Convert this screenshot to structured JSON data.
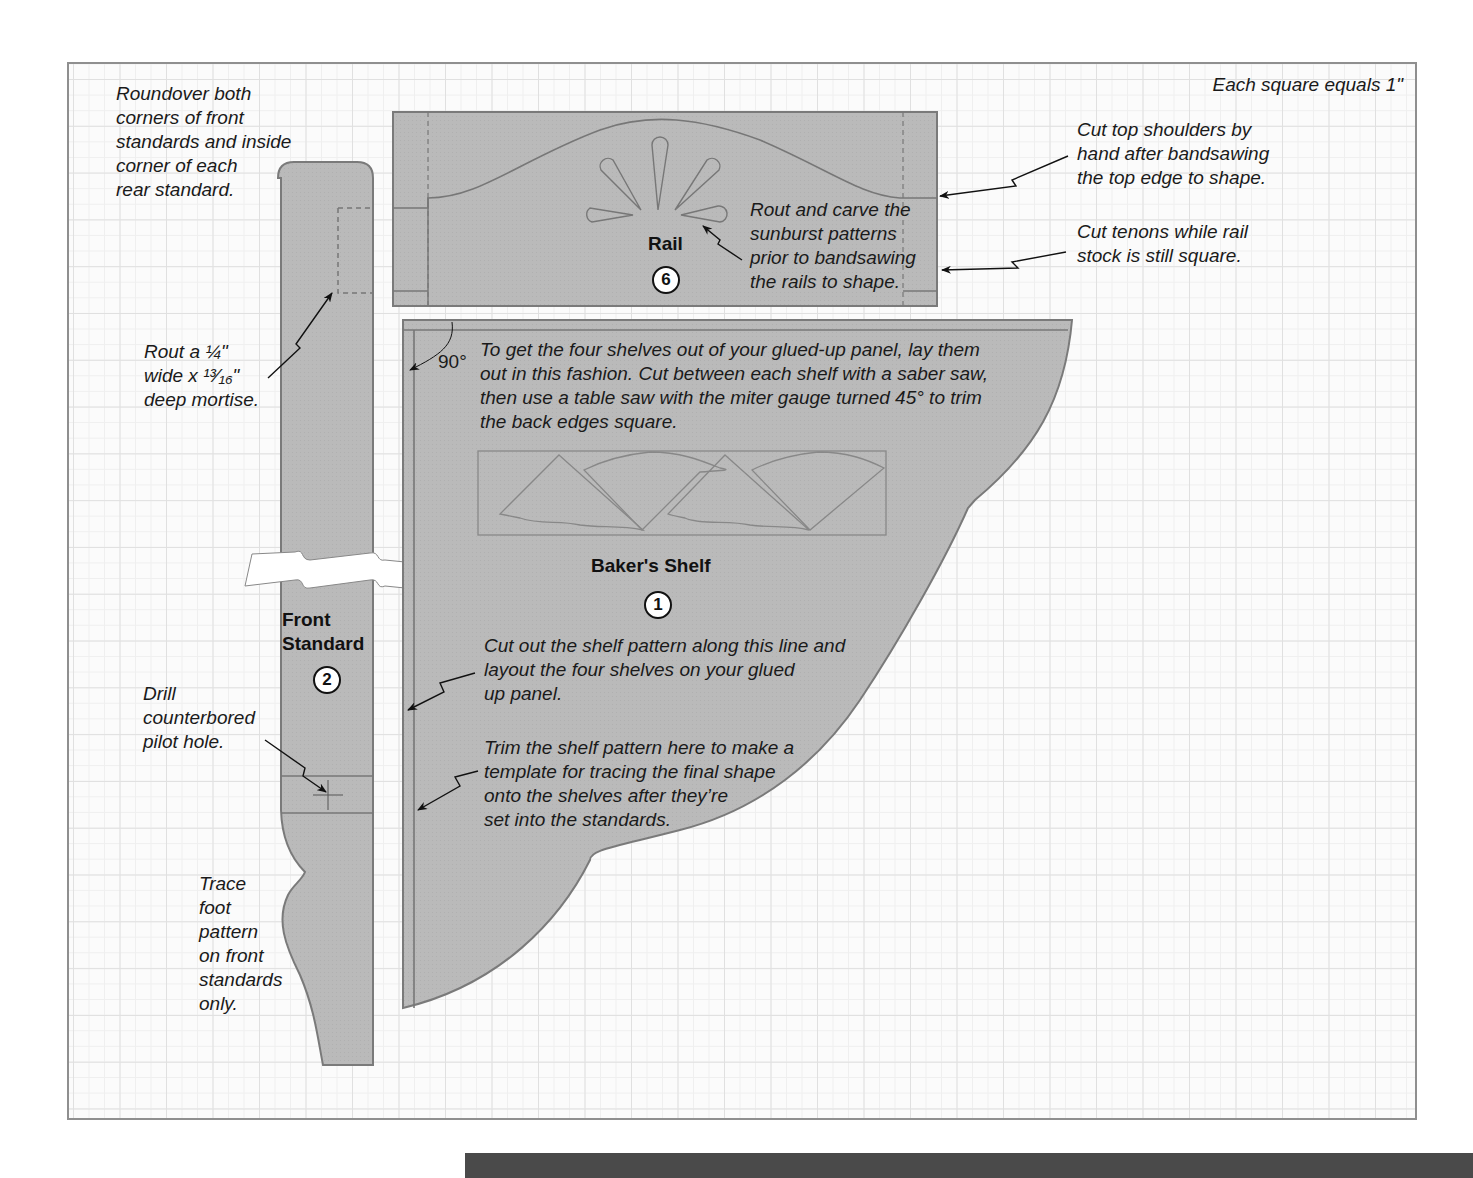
{
  "diagram": {
    "scale_note": "Each square equals 1\"",
    "grid": {
      "square_size_inches": 1
    },
    "colors": {
      "part_fill": "#b9b9b9",
      "part_stroke": "#7a7a7a",
      "grid_line": "#e0e0e0",
      "background": "#fbfbfb",
      "text": "#1a1a1a"
    },
    "parts": {
      "rail": {
        "name": "Rail",
        "number": "6"
      },
      "bakers_shelf": {
        "name": "Baker's Shelf",
        "number": "1"
      },
      "front_standard": {
        "name": "Front\nStandard",
        "number": "2"
      }
    },
    "dimensions": {
      "angle": "90°"
    },
    "notes": {
      "roundover": "Roundover both\ncorners of front\nstandards and inside\ncorner of each\nrear standard.",
      "mortise": "Rout a ¼\"\nwide x ¹³⁄₁₆\"\ndeep mortise.",
      "drill": "Drill\ncounterbored\npilot hole.",
      "trace_foot": "Trace\nfoot\npattern\non front\nstandards\nonly.",
      "sunburst": "Rout and carve the\nsunburst patterns\nprior to bandsawing\nthe rails to shape.",
      "shoulders": "Cut top shoulders by\nhand after bandsawing\nthe top edge to shape.",
      "tenons": "Cut tenons while rail\nstock is still square.",
      "layout": "To get the four shelves out of your glued-up panel, lay them\nout in this fashion. Cut between each shelf with a saber saw,\nthen use a table saw with the miter gauge turned 45° to trim\nthe back edges square.",
      "cut_out": "Cut out the shelf pattern along this line and\nlayout the four shelves on your glued\nup panel.",
      "trim": "Trim the shelf pattern here to make a\ntemplate for tracing the final shape\nonto the shelves after they’re\nset into the standards."
    }
  }
}
